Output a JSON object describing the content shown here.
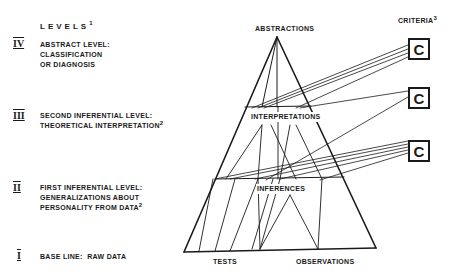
{
  "levels": {
    "title": "LEVELS",
    "title_note": "1",
    "items": [
      {
        "numeral": "IV",
        "lines": [
          "ABSTRACT LEVEL:",
          "CLASSIFICATION",
          "OR DIAGNOSIS"
        ],
        "note": ""
      },
      {
        "numeral": "III",
        "lines": [
          "SECOND INFERENTIAL LEVEL:",
          "THEORETICAL INTERPRETATION"
        ],
        "note": "2"
      },
      {
        "numeral": "II",
        "lines": [
          "FIRST INFERENTIAL LEVEL:",
          "GENERALIZATIONS ABOUT",
          "PERSONALITY FROM DATA"
        ],
        "note": "2"
      },
      {
        "numeral": "I",
        "lines": [
          "BASE LINE:  RAW DATA"
        ],
        "note": ""
      }
    ]
  },
  "pyramid": {
    "apex_label": "ABSTRACTIONS",
    "interpretations_label": "INTERPRETATIONS",
    "inferences_label": "INFERENCES",
    "base_left_label": "TESTS",
    "base_right_label": "OBSERVATIONS"
  },
  "criteria": {
    "title": "CRITERIA",
    "title_note": "3",
    "boxes": [
      "C",
      "C",
      "C"
    ]
  },
  "colors": {
    "ink": "#1a1a1a",
    "background": "#ffffff"
  }
}
